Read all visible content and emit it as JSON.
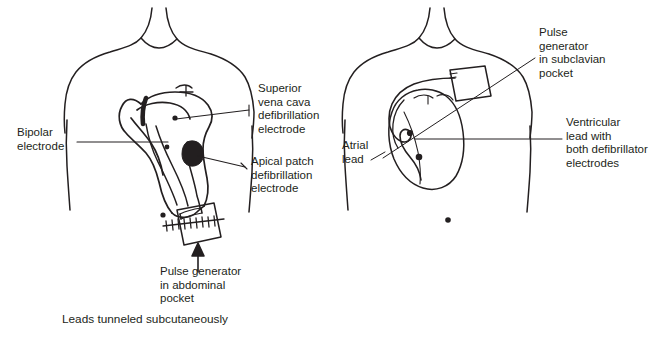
{
  "figure": {
    "type": "medical-diagram",
    "ink_color": "#231f20",
    "background_color": "#ffffff",
    "panels": [
      {
        "id": "left-panel",
        "name": "epicardial-abdominal-system",
        "labels": {
          "bipolar_electrode": "Bipolar\nelectrode",
          "superior_vena_cava": "Superior\nvena cava\ndefibrillation\nelectrode",
          "apical_patch": "Apical patch\ndefibrillation\nelectrode",
          "pulse_generator": "Pulse generator\nin abdominal\npocket",
          "caption": "Leads tunneled subcutaneously"
        }
      },
      {
        "id": "right-panel",
        "name": "transvenous-subclavian-system",
        "labels": {
          "pulse_generator": "Pulse\ngenerator\nin subclavian\npocket",
          "atrial_lead": "Atrial\nlead",
          "ventricular_lead": "Ventricular\nlead with\nboth defibrillator\nelectrodes"
        }
      }
    ]
  }
}
